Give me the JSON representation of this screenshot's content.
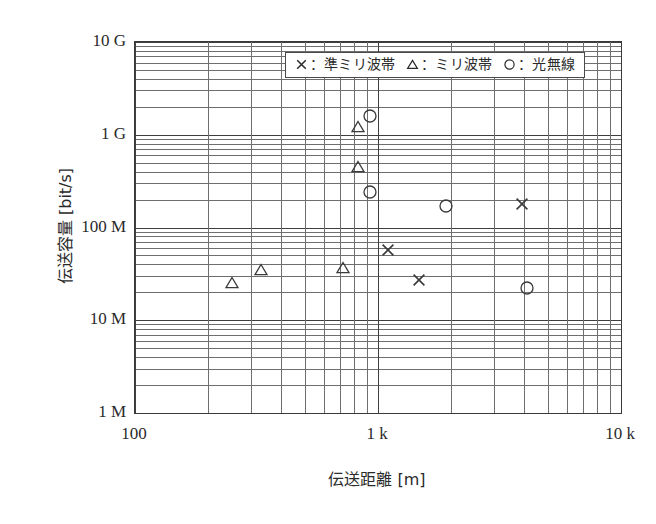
{
  "chart_data": {
    "type": "scatter",
    "title": "",
    "xlabel": "伝送距離 [m]",
    "ylabel": "伝送容量 [bit/s]",
    "xscale": "log",
    "yscale": "log",
    "xlim": [
      100,
      10000
    ],
    "ylim": [
      1000000,
      10000000000
    ],
    "grid": true,
    "legend_position": "top-center-inside",
    "xtick_labels": [
      "100",
      "1 k",
      "10 k"
    ],
    "xtick_values": [
      100,
      1000,
      10000
    ],
    "ytick_labels": [
      "10 G",
      "1 G",
      "100 M",
      "10 M",
      "1 M"
    ],
    "ytick_values": [
      10000000000,
      1000000000,
      100000000,
      10000000,
      1000000
    ],
    "series": [
      {
        "name": "準ミリ波帯",
        "marker": "x",
        "legend_label": "×：準ミリ波帯",
        "points": [
          {
            "x": 1100,
            "y": 57000000
          },
          {
            "x": 1480,
            "y": 27000000
          },
          {
            "x": 3900,
            "y": 180000000
          }
        ]
      },
      {
        "name": "ミリ波帯",
        "marker": "triangle",
        "legend_label": "△：ミリ波帯",
        "points": [
          {
            "x": 250,
            "y": 25000000
          },
          {
            "x": 330,
            "y": 35000000
          },
          {
            "x": 720,
            "y": 37000000
          },
          {
            "x": 830,
            "y": 450000000
          },
          {
            "x": 830,
            "y": 1200000000
          }
        ]
      },
      {
        "name": "光無線",
        "marker": "circle",
        "legend_label": "○：光無線",
        "points": [
          {
            "x": 930,
            "y": 1600000000
          },
          {
            "x": 930,
            "y": 240000000
          },
          {
            "x": 1900,
            "y": 170000000
          },
          {
            "x": 4100,
            "y": 22000000
          }
        ]
      }
    ]
  },
  "legend": {
    "entries": [
      {
        "glyph": "cross-icon",
        "label": "：準ミリ波帯"
      },
      {
        "glyph": "triangle-icon",
        "label": "：ミリ波帯"
      },
      {
        "glyph": "circle-icon",
        "label": "：光無線"
      }
    ]
  },
  "axes": {
    "y_title": "伝送容量 [bit/s]",
    "x_title": "伝送距離 [m]"
  },
  "colors": {
    "ink": "#2a2a2a",
    "grid_minor": "#6e6e6e",
    "grid_major": "#3f3f3f",
    "frame": "#3a3a3a",
    "background": "#ffffff"
  }
}
